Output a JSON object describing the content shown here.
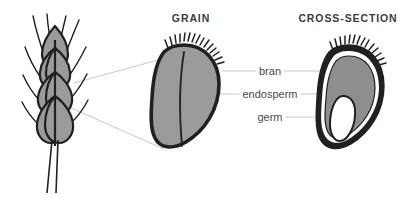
{
  "figure": {
    "title_grain": "GRAIN",
    "title_cross_section": "CROSS-SECTION",
    "labels": {
      "bran": "bran",
      "endosperm": "endosperm",
      "germ": "germ"
    },
    "colors": {
      "background": "#ffffff",
      "outline": "#231f20",
      "fill_gray": "#9b9b9b",
      "fill_gray_dark": "#8e8e8e",
      "heading_text": "#3b3b3b",
      "label_text": "#4a4a4a",
      "leader_line": "#c8c8c8"
    },
    "parts": {
      "wheat_stalk": "wheat-stalk",
      "grain": "wheat-grain",
      "cross_section": "wheat-grain-cross-section"
    }
  }
}
